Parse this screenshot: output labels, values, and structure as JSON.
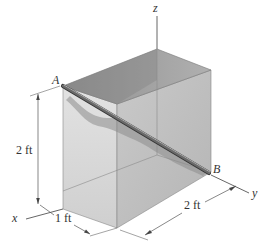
{
  "diagram": {
    "type": "3d-rod-in-box",
    "axes": {
      "x_label": "x",
      "y_label": "y",
      "z_label": "z"
    },
    "points": {
      "A_label": "A",
      "B_label": "B"
    },
    "dimensions": {
      "height": "2 ft",
      "x_depth": "1 ft",
      "y_width": "2 ft"
    },
    "colors": {
      "box_top": "#9a9a9a",
      "box_front": "#d8d8d8",
      "box_side": "#c4c4c4",
      "rod": "#555555",
      "edge": "#777777",
      "dim_line": "#555555",
      "shadow": "#8c8c8c"
    }
  }
}
